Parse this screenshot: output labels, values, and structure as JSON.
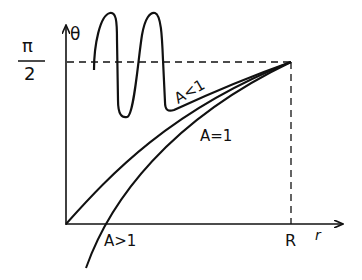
{
  "diagram": {
    "y_axis_label": "θ",
    "y_tick_numerator": "π",
    "y_tick_denominator": "2",
    "x_axis_label": "r",
    "x_tick_label": "R",
    "curves": [
      {
        "name": "A<1",
        "label": "A<1"
      },
      {
        "name": "A=1",
        "label": "A=1"
      },
      {
        "name": "A>1",
        "label": "A>1"
      }
    ],
    "stroke_color": "#111111"
  }
}
